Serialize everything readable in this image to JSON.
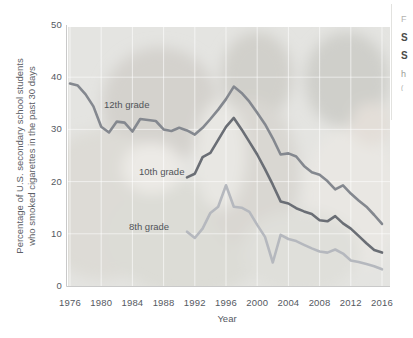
{
  "caption": {
    "fragments": [
      "F",
      "S",
      "S",
      "h",
      "("
    ]
  },
  "chart_data": {
    "type": "line",
    "title": "",
    "xlabel": "Year",
    "ylabel": "Percentage of U.S. secondary school students who smoked cigarettes in the past 30 days",
    "ylabel_lines": [
      "Percentage of U.S. secondary school students",
      "who smoked cigarettes in the past 30 days"
    ],
    "xlim": [
      1975,
      2017
    ],
    "ylim": [
      0,
      50
    ],
    "x_ticks": [
      1976,
      1980,
      1984,
      1988,
      1992,
      1996,
      2000,
      2004,
      2008,
      2012,
      2016
    ],
    "y_ticks": [
      0,
      10,
      20,
      30,
      40,
      50
    ],
    "grid": true,
    "legend_position": "inline-labels",
    "background": "faded photograph of school children",
    "series": [
      {
        "name": "12th grade",
        "color": "#84888f",
        "x_start": 1976,
        "values": [
          38.8,
          38.4,
          36.7,
          34.4,
          30.5,
          29.4,
          31.5,
          31.3,
          29.6,
          32.0,
          31.8,
          31.6,
          30.0,
          29.7,
          30.3,
          29.8,
          29.0,
          30.3,
          32.0,
          33.8,
          35.8,
          38.2,
          37.0,
          35.3,
          33.2,
          31.0,
          28.3,
          25.2,
          25.4,
          24.8,
          23.0,
          21.8,
          21.3,
          20.1,
          18.5,
          19.3,
          17.7,
          16.4,
          15.2,
          13.6,
          11.9
        ]
      },
      {
        "name": "10th grade",
        "color": "#6a6e75",
        "x_start": 1991,
        "values": [
          20.8,
          21.5,
          24.7,
          25.5,
          28.0,
          30.5,
          32.2,
          30.0,
          27.6,
          25.2,
          22.4,
          19.4,
          16.2,
          15.8,
          14.9,
          14.3,
          13.8,
          12.6,
          12.4,
          13.4,
          12.0,
          11.0,
          9.6,
          8.2,
          6.9,
          6.4
        ]
      },
      {
        "name": "8th grade",
        "color": "#b5b8be",
        "x_start": 1991,
        "values": [
          10.4,
          9.2,
          11.0,
          14.0,
          15.2,
          19.3,
          15.2,
          15.0,
          14.2,
          11.7,
          9.4,
          4.5,
          9.8,
          9.0,
          8.6,
          7.9,
          7.2,
          6.6,
          6.4,
          7.0,
          6.2,
          4.9,
          4.6,
          4.2,
          3.8,
          3.2
        ]
      }
    ]
  }
}
